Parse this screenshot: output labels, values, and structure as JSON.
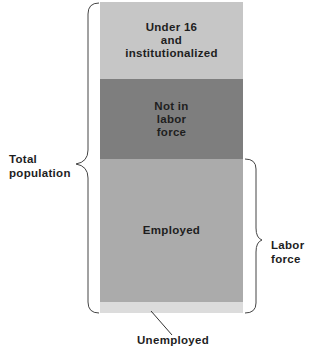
{
  "diagram": {
    "segments": [
      {
        "id": "under16",
        "label": "Under 16\nand\ninstitutionalized",
        "color": "#c6c6c6"
      },
      {
        "id": "not_in_labor_force",
        "label": "Not in\nlabor\nforce",
        "color": "#7e7e7e"
      },
      {
        "id": "employed",
        "label": "Employed",
        "color": "#ababab"
      },
      {
        "id": "unemployed",
        "label": "",
        "color": "#dcdcdc"
      }
    ],
    "brackets": {
      "total_population": {
        "label": "Total\npopulation"
      },
      "labor_force": {
        "label": "Labor\nforce"
      }
    },
    "callouts": {
      "unemployed": {
        "label": "Unemployed"
      }
    }
  }
}
